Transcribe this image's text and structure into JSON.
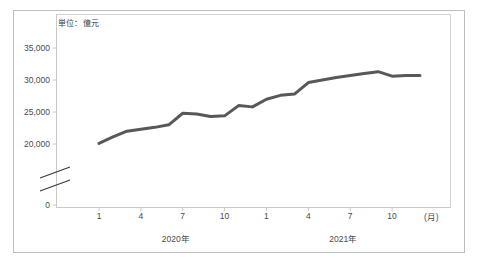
{
  "figure": {
    "unit_note": "単位：億元",
    "x_axis_unit_label": "(月)",
    "line_color": "#585858",
    "frame_color": "#bdbdbd",
    "axis_color": "#c8c8c8",
    "text_color": "#4a4a4a"
  },
  "chart_data": {
    "type": "line",
    "title": "",
    "subtitle": "",
    "xlabel": "(月)",
    "ylabel": "",
    "unit": "億元",
    "grid": false,
    "legend": null,
    "axis_break": true,
    "ylim": [
      0,
      35000
    ],
    "ytick_labels": [
      "0",
      "20,000",
      "25,000",
      "30,000",
      "35,000"
    ],
    "ytick_values": [
      0,
      20000,
      25000,
      30000,
      35000
    ],
    "xtick_labels": [
      "1",
      "4",
      "7",
      "10",
      "1",
      "4",
      "7",
      "10"
    ],
    "xtick_months": [
      1,
      4,
      7,
      10,
      13,
      16,
      19,
      22
    ],
    "group_labels": [
      "2020年",
      "2021年"
    ],
    "categories": [
      "2020-1",
      "2020-2",
      "2020-3",
      "2020-4",
      "2020-5",
      "2020-6",
      "2020-7",
      "2020-8",
      "2020-9",
      "2020-10",
      "2020-11",
      "2020-12",
      "2021-1",
      "2021-2",
      "2021-3",
      "2021-4",
      "2021-5",
      "2021-6",
      "2021-7",
      "2021-8",
      "2021-9",
      "2021-10",
      "2021-11",
      "2021-12"
    ],
    "values": [
      20100,
      21100,
      22000,
      22300,
      22600,
      23000,
      24800,
      24700,
      24300,
      24400,
      26000,
      25800,
      27000,
      27600,
      27800,
      29600,
      30000,
      30400,
      30700,
      31000,
      31300,
      30600,
      30700,
      30700
    ],
    "series": [
      {
        "name": "",
        "values": [
          20100,
          21100,
          22000,
          22300,
          22600,
          23000,
          24800,
          24700,
          24300,
          24400,
          26000,
          25800,
          27000,
          27600,
          27800,
          29600,
          30000,
          30400,
          30700,
          31000,
          31300,
          30600,
          30700,
          30700
        ]
      }
    ]
  }
}
